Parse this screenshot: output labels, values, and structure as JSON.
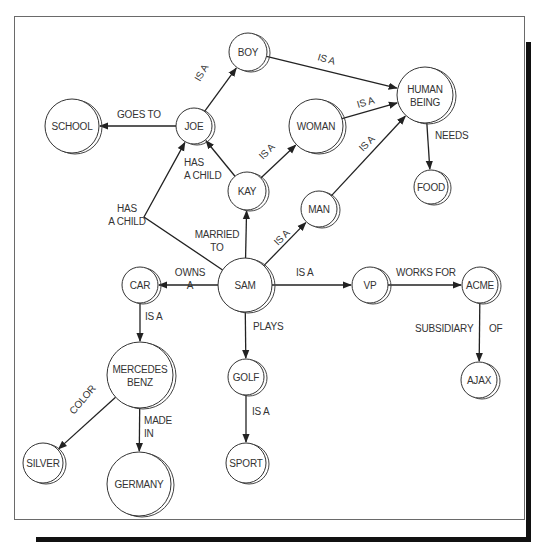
{
  "diagram": {
    "type": "semantic-network",
    "nodes": [
      {
        "id": "boy",
        "label": [
          "BOY"
        ],
        "x": 248,
        "y": 52,
        "r": 19
      },
      {
        "id": "human_being",
        "label": [
          "HUMAN",
          "BEING"
        ],
        "x": 425,
        "y": 95,
        "r": 28
      },
      {
        "id": "school",
        "label": [
          "SCHOOL"
        ],
        "x": 72,
        "y": 126,
        "r": 27
      },
      {
        "id": "joe",
        "label": [
          "JOE"
        ],
        "x": 194,
        "y": 126,
        "r": 18
      },
      {
        "id": "woman",
        "label": [
          "WOMAN"
        ],
        "x": 316,
        "y": 126,
        "r": 27
      },
      {
        "id": "kay",
        "label": [
          "KAY"
        ],
        "x": 247,
        "y": 191,
        "r": 19
      },
      {
        "id": "man",
        "label": [
          "MAN"
        ],
        "x": 319,
        "y": 209,
        "r": 18
      },
      {
        "id": "food",
        "label": [
          "FOOD"
        ],
        "x": 431,
        "y": 187,
        "r": 17
      },
      {
        "id": "car",
        "label": [
          "CAR"
        ],
        "x": 140,
        "y": 285,
        "r": 18
      },
      {
        "id": "sam",
        "label": [
          "SAM"
        ],
        "x": 245,
        "y": 285,
        "r": 27
      },
      {
        "id": "vp",
        "label": [
          "VP"
        ],
        "x": 370,
        "y": 285,
        "r": 18
      },
      {
        "id": "acme",
        "label": [
          "ACME"
        ],
        "x": 480,
        "y": 285,
        "r": 18
      },
      {
        "id": "mercedes_benz",
        "label": [
          "MERCEDES",
          "BENZ"
        ],
        "x": 140,
        "y": 375,
        "r": 33
      },
      {
        "id": "golf",
        "label": [
          "GOLF"
        ],
        "x": 246,
        "y": 377,
        "r": 18
      },
      {
        "id": "ajax",
        "label": [
          "AJAX"
        ],
        "x": 479,
        "y": 380,
        "r": 18
      },
      {
        "id": "silver",
        "label": [
          "SILVER"
        ],
        "x": 43,
        "y": 463,
        "r": 20
      },
      {
        "id": "germany",
        "label": [
          "GERMANY"
        ],
        "x": 139,
        "y": 484,
        "r": 32
      },
      {
        "id": "sport",
        "label": [
          "SPORT"
        ],
        "x": 246,
        "y": 463,
        "r": 20
      }
    ],
    "edges": [
      {
        "from": "joe",
        "to": "boy",
        "label": [
          "IS A"
        ],
        "lx": 200,
        "ly": 82,
        "rot": -60
      },
      {
        "from": "boy",
        "to": "human_being",
        "label": [
          "IS A"
        ],
        "lx": 317,
        "ly": 60,
        "rot": 16
      },
      {
        "from": "joe",
        "to": "school",
        "label": [
          "GOES TO"
        ],
        "lx": 117,
        "ly": 118,
        "rot": 0
      },
      {
        "from": "woman",
        "to": "human_being",
        "label": [
          "IS A"
        ],
        "lx": 358,
        "ly": 108,
        "rot": -16
      },
      {
        "from": "human_being",
        "to": "food",
        "label": [
          "NEEDS"
        ],
        "lx": 435,
        "ly": 139,
        "rot": 0
      },
      {
        "from": "kay",
        "to": "joe",
        "label": [
          "HAS",
          "A CHILD"
        ],
        "lx": 184,
        "ly": 166,
        "rot": 0,
        "anchor": "start"
      },
      {
        "from": "kay",
        "to": "woman",
        "label": [
          "IS A"
        ],
        "lx": 263,
        "ly": 160,
        "rot": -45
      },
      {
        "from": "man",
        "to": "human_being",
        "label": [
          "IS A"
        ],
        "lx": 363,
        "ly": 152,
        "rot": -45
      },
      {
        "from": "sam",
        "to": "kay",
        "label": [
          "MARRIED",
          "TO"
        ],
        "lx": 217,
        "ly": 238,
        "rot": 0,
        "anchor": "middle"
      },
      {
        "from": "sam",
        "to": "man",
        "label": [
          "IS A"
        ],
        "lx": 278,
        "ly": 246,
        "rot": -45
      },
      {
        "from": "sam",
        "to": "joe",
        "label": [
          "HAS",
          "A CHILD"
        ],
        "lx": 127,
        "ly": 212,
        "rot": 0,
        "anchor": "middle",
        "via": [
          144,
          217
        ]
      },
      {
        "from": "sam",
        "to": "car",
        "label": [
          "OWNS",
          "A"
        ],
        "lx": 190,
        "ly": 276,
        "rot": 0,
        "anchor": "middle"
      },
      {
        "from": "sam",
        "to": "vp",
        "label": [
          "IS A"
        ],
        "lx": 296,
        "ly": 276,
        "rot": 0
      },
      {
        "from": "vp",
        "to": "acme",
        "label": [
          "WORKS FOR"
        ],
        "lx": 396,
        "ly": 276,
        "rot": 0
      },
      {
        "from": "acme",
        "to": "ajax",
        "label": [
          "SUBSIDIARY",
          "OF"
        ],
        "lx": 415,
        "ly": 332,
        "rot": 0,
        "split": true
      },
      {
        "from": "car",
        "to": "mercedes_benz",
        "label": [
          "IS A"
        ],
        "lx": 145,
        "ly": 320,
        "rot": 0
      },
      {
        "from": "sam",
        "to": "golf",
        "label": [
          "PLAYS"
        ],
        "lx": 253,
        "ly": 330,
        "rot": 0
      },
      {
        "from": "mercedes_benz",
        "to": "silver",
        "label": [
          "COLOR"
        ],
        "lx": 74,
        "ly": 415,
        "rot": -50
      },
      {
        "from": "mercedes_benz",
        "to": "germany",
        "label": [
          "MADE",
          "IN"
        ],
        "lx": 144,
        "ly": 424,
        "rot": 0
      },
      {
        "from": "golf",
        "to": "sport",
        "label": [
          "IS A"
        ],
        "lx": 252,
        "ly": 415,
        "rot": 0
      }
    ]
  }
}
